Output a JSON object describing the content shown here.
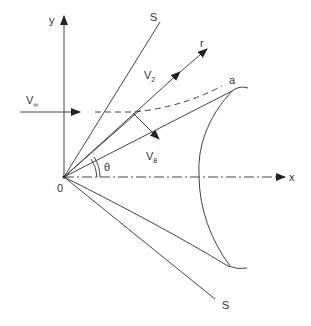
{
  "figure": {
    "labels": {
      "y_axis": "y",
      "x_axis": "x",
      "origin": "0",
      "shock_upper": "S",
      "shock_lower": "S",
      "radial": "r",
      "cone_surface_point": "a",
      "freestream_main": "V",
      "freestream_sub": "∞",
      "v2_main": "V",
      "v2_sub": "2",
      "vtheta_main": "V",
      "vtheta_sub": "θ",
      "angle": "θ"
    },
    "colors": {
      "line": "#444444",
      "text": "#333333",
      "background": "#ffffff"
    }
  }
}
